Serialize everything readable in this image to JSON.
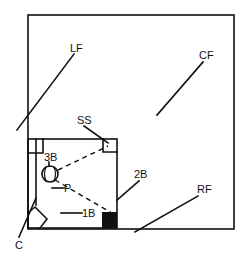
{
  "diagram": {
    "labels": {
      "lf": "LF",
      "cf": "CF",
      "ss": "SS",
      "third_base": "3B",
      "pitcher": "P",
      "second_base": "2B",
      "first_base": "1B",
      "rf": "RF",
      "catcher": "C"
    },
    "colors": {
      "ink": "#111111",
      "background": "#ffffff"
    }
  }
}
